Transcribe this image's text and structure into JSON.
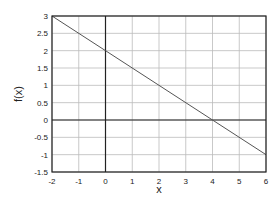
{
  "chart_data": {
    "type": "line",
    "title": "",
    "xlabel": "x",
    "ylabel": "f(x)",
    "xlim": [
      -2,
      6
    ],
    "ylim": [
      -1.5,
      3
    ],
    "grid": true,
    "x_ticks": [
      "-2",
      "-1",
      "0",
      "1",
      "2",
      "3",
      "4",
      "5",
      "6"
    ],
    "y_ticks": [
      "-1.5",
      "-1",
      "-0.5",
      "0",
      "0.5",
      "1",
      "1.5",
      "2",
      "2.5",
      "3"
    ],
    "series": [
      {
        "name": "f(x)",
        "x": [
          -2,
          0,
          4,
          6
        ],
        "y": [
          3,
          2,
          0,
          -1
        ]
      }
    ],
    "axis_lines": {
      "x0": true,
      "y0": true
    }
  }
}
